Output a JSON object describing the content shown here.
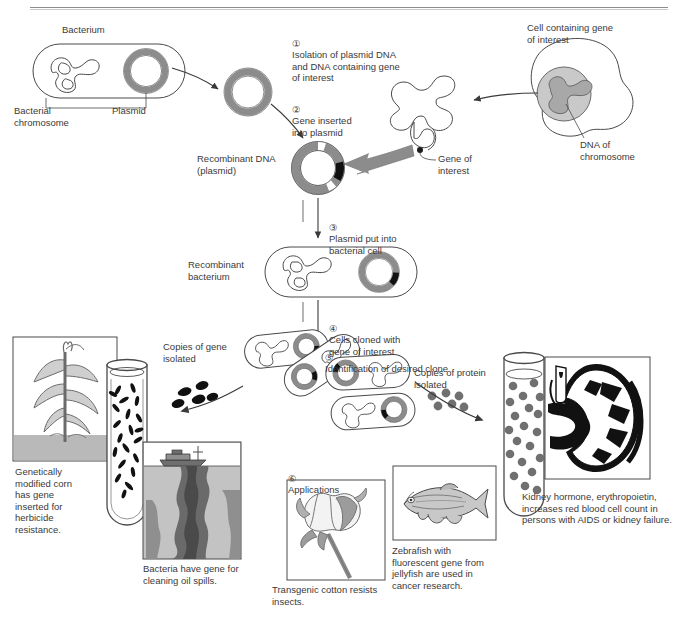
{
  "diagram": {
    "type": "process-flow-diagram",
    "colors": {
      "plasmid_gray": "#8c8c8c",
      "gene_black": "#111111",
      "cell_fill": "#ffffff",
      "nucleus_gray": "#c9c9c9",
      "arrow_gray": "#8c8c8c",
      "line_dark": "#3a3a3a",
      "protein_dot": "#707070",
      "water_gray": "#b7b7b7",
      "oil_dark": "#5e5e5e"
    }
  },
  "labels": {
    "bacterium": "Bacterium",
    "bacterial_chromosome": "Bacterial\nchromosome",
    "plasmid": "Plasmid",
    "cell_containing_gene": "Cell containing gene\nof interest",
    "dna_of_chromosome": "DNA of\nchromosome",
    "gene_of_interest": "Gene of\ninterest",
    "recombinant_dna": "Recombinant DNA\n(plasmid)",
    "recombinant_bacterium": "Recombinant\nbacterium",
    "copies_of_gene": "Copies of gene\nisolated",
    "copies_of_protein": "Copies of protein\nisolated"
  },
  "steps": [
    {
      "num": "1",
      "glyph": "①",
      "text": "Isolation of plasmid DNA\nand DNA containing gene\nof interest"
    },
    {
      "num": "2",
      "glyph": "②",
      "text": "Gene inserted\ninto plasmid"
    },
    {
      "num": "3",
      "glyph": "③",
      "text": "Plasmid put into\nbacterial cell"
    },
    {
      "num": "4",
      "glyph": "④",
      "text": "Cells cloned with\ngene of interest"
    },
    {
      "num": "5",
      "glyph": "⑤",
      "text": "Identification of desired clone"
    },
    {
      "num": "6",
      "glyph": "⑥",
      "text": "Applications"
    }
  ],
  "applications": [
    {
      "id": "corn",
      "caption": "Genetically\nmodified corn\nhas gene\ninserted for\nherbicide\nresistance."
    },
    {
      "id": "oil-spill",
      "caption": "Bacteria have gene for\ncleaning oil spills."
    },
    {
      "id": "cotton",
      "caption": "Transgenic cotton resists\ninsects."
    },
    {
      "id": "zebrafish",
      "caption": "Zebrafish with\nfluorescent gene from\njellyfish are used in\ncancer research."
    },
    {
      "id": "kidney",
      "caption": "Kidney hormone, erythropoietin,\nincreases red blood cell count in\npersons with AIDS or kidney failure."
    }
  ]
}
